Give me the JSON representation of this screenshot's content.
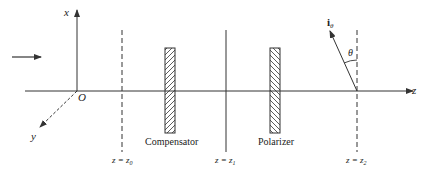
{
  "diagram": {
    "axes": {
      "x_label": "x",
      "y_label": "y",
      "z_label": "z",
      "origin_label": "O"
    },
    "components": [
      {
        "name": "Compensator",
        "label": "Compensator",
        "hatch": "forward"
      },
      {
        "name": "Polarizer",
        "label": "Polarizer",
        "hatch": "backward"
      }
    ],
    "planes": [
      {
        "label_lhs": "z = z",
        "sub": "0",
        "style": "dashed"
      },
      {
        "label_lhs": "z = z",
        "sub": "1",
        "style": "solid"
      },
      {
        "label_lhs": "z = z",
        "sub": "2",
        "style": "dashed"
      }
    ],
    "vector": {
      "label": "i",
      "sub": "θ",
      "angle_label": "θ"
    },
    "incident_arrow": "light-propagation-arrow",
    "colors": {
      "line": "#333333",
      "background": "#ffffff"
    }
  }
}
